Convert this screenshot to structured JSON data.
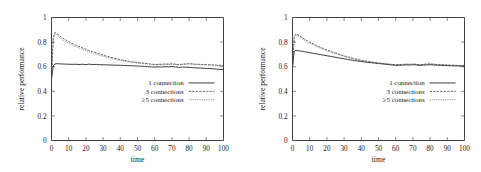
{
  "figure": {
    "panel_count": 2
  },
  "chart_data": [
    {
      "type": "line",
      "title": "",
      "xlabel": "time",
      "ylabel": "relative performance",
      "xlim": [
        0,
        100
      ],
      "ylim": [
        0,
        1
      ],
      "xticks": [
        0,
        10,
        20,
        30,
        40,
        50,
        60,
        70,
        80,
        90,
        100
      ],
      "xticklabels": [
        "0",
        "10",
        "20",
        "30",
        "40",
        "50",
        "60",
        "70",
        "80",
        "90",
        "100"
      ],
      "yticks": [
        0,
        0.2,
        0.4,
        0.6,
        0.8,
        1
      ],
      "yticklabels": [
        "0",
        "0.2",
        "0.4",
        "0.6",
        "0.8",
        "1"
      ],
      "grid": false,
      "legend_position": "center-right",
      "legend": [
        "1 connection",
        "3 connections",
        "≥5 connections"
      ],
      "x": [
        0,
        1,
        2,
        3,
        4,
        5,
        6,
        8,
        10,
        12,
        14,
        16,
        18,
        20,
        22,
        24,
        26,
        28,
        30,
        32,
        34,
        36,
        38,
        40,
        42,
        44,
        46,
        48,
        50,
        52,
        54,
        56,
        58,
        60,
        62,
        64,
        66,
        68,
        70,
        72,
        74,
        76,
        78,
        80,
        82,
        84,
        86,
        88,
        90,
        92,
        94,
        96,
        98,
        100
      ],
      "series": [
        {
          "name": "1 connection",
          "style": "solid",
          "values": [
            0.5,
            0.605,
            0.622,
            0.625,
            0.624,
            0.623,
            0.622,
            0.621,
            0.62,
            0.619,
            0.62,
            0.618,
            0.62,
            0.617,
            0.621,
            0.617,
            0.619,
            0.616,
            0.616,
            0.615,
            0.614,
            0.613,
            0.612,
            0.612,
            0.61,
            0.609,
            0.608,
            0.607,
            0.605,
            0.604,
            0.603,
            0.6,
            0.598,
            0.597,
            0.599,
            0.598,
            0.6,
            0.599,
            0.601,
            0.598,
            0.594,
            0.597,
            0.596,
            0.595,
            0.593,
            0.59,
            0.589,
            0.588,
            0.586,
            0.585,
            0.583,
            0.58,
            0.578,
            0.576
          ]
        },
        {
          "name": "3 connections",
          "style": "dashed",
          "values": [
            0.5,
            0.84,
            0.878,
            0.872,
            0.86,
            0.848,
            0.838,
            0.82,
            0.803,
            0.789,
            0.776,
            0.765,
            0.753,
            0.742,
            0.731,
            0.722,
            0.712,
            0.703,
            0.694,
            0.686,
            0.678,
            0.671,
            0.664,
            0.658,
            0.652,
            0.647,
            0.642,
            0.638,
            0.634,
            0.631,
            0.628,
            0.625,
            0.621,
            0.618,
            0.619,
            0.62,
            0.622,
            0.621,
            0.623,
            0.621,
            0.617,
            0.62,
            0.623,
            0.625,
            0.623,
            0.62,
            0.619,
            0.618,
            0.617,
            0.616,
            0.615,
            0.613,
            0.612,
            0.611
          ]
        },
        {
          "name": "≥5 connections",
          "style": "dotted",
          "values": [
            0.5,
            0.828,
            0.864,
            0.858,
            0.846,
            0.834,
            0.824,
            0.806,
            0.79,
            0.776,
            0.764,
            0.753,
            0.741,
            0.731,
            0.72,
            0.711,
            0.702,
            0.693,
            0.685,
            0.677,
            0.67,
            0.663,
            0.657,
            0.651,
            0.646,
            0.641,
            0.637,
            0.633,
            0.63,
            0.627,
            0.624,
            0.621,
            0.618,
            0.615,
            0.616,
            0.617,
            0.619,
            0.618,
            0.62,
            0.618,
            0.614,
            0.617,
            0.62,
            0.622,
            0.62,
            0.617,
            0.616,
            0.615,
            0.614,
            0.613,
            0.612,
            0.61,
            0.609,
            0.608
          ]
        }
      ]
    },
    {
      "type": "line",
      "title": "",
      "xlabel": "time",
      "ylabel": "relative performance",
      "xlim": [
        0,
        100
      ],
      "ylim": [
        0,
        1
      ],
      "xticks": [
        0,
        10,
        20,
        30,
        40,
        50,
        60,
        70,
        80,
        90,
        100
      ],
      "xticklabels": [
        "0",
        "10",
        "20",
        "30",
        "40",
        "50",
        "60",
        "70",
        "80",
        "90",
        "100"
      ],
      "yticks": [
        0,
        0.2,
        0.4,
        0.6,
        0.8,
        1
      ],
      "yticklabels": [
        "0",
        "0.2",
        "0.4",
        "0.6",
        "0.8",
        "1"
      ],
      "grid": false,
      "legend_position": "center-right",
      "legend": [
        "1 connection",
        "3 connections",
        "≥5 connections"
      ],
      "x": [
        0,
        1,
        2,
        3,
        4,
        5,
        6,
        8,
        10,
        12,
        14,
        16,
        18,
        20,
        22,
        24,
        26,
        28,
        30,
        32,
        34,
        36,
        38,
        40,
        42,
        44,
        46,
        48,
        50,
        52,
        54,
        56,
        58,
        60,
        62,
        64,
        66,
        68,
        70,
        72,
        74,
        76,
        78,
        80,
        82,
        84,
        86,
        88,
        90,
        92,
        94,
        96,
        98,
        100
      ],
      "series": [
        {
          "name": "1 connection",
          "style": "solid",
          "values": [
            0.595,
            0.726,
            0.733,
            0.731,
            0.729,
            0.727,
            0.724,
            0.719,
            0.714,
            0.709,
            0.704,
            0.699,
            0.694,
            0.689,
            0.684,
            0.679,
            0.674,
            0.669,
            0.664,
            0.659,
            0.654,
            0.65,
            0.646,
            0.642,
            0.638,
            0.635,
            0.632,
            0.629,
            0.626,
            0.623,
            0.62,
            0.617,
            0.614,
            0.611,
            0.612,
            0.613,
            0.615,
            0.614,
            0.616,
            0.614,
            0.611,
            0.613,
            0.615,
            0.616,
            0.614,
            0.612,
            0.611,
            0.61,
            0.609,
            0.608,
            0.607,
            0.606,
            0.605,
            0.604
          ]
        },
        {
          "name": "3 connections",
          "style": "dashed",
          "values": [
            0.595,
            0.848,
            0.866,
            0.86,
            0.851,
            0.842,
            0.833,
            0.816,
            0.8,
            0.786,
            0.773,
            0.76,
            0.748,
            0.737,
            0.726,
            0.716,
            0.706,
            0.697,
            0.688,
            0.68,
            0.672,
            0.665,
            0.658,
            0.652,
            0.647,
            0.642,
            0.638,
            0.634,
            0.63,
            0.627,
            0.624,
            0.621,
            0.618,
            0.616,
            0.617,
            0.619,
            0.621,
            0.62,
            0.622,
            0.62,
            0.616,
            0.619,
            0.622,
            0.623,
            0.621,
            0.618,
            0.617,
            0.616,
            0.614,
            0.613,
            0.612,
            0.611,
            0.61,
            0.609
          ]
        },
        {
          "name": "≥5 connections",
          "style": "dotted",
          "values": [
            0.595,
            0.838,
            0.856,
            0.85,
            0.841,
            0.832,
            0.823,
            0.806,
            0.791,
            0.777,
            0.764,
            0.752,
            0.741,
            0.73,
            0.72,
            0.71,
            0.701,
            0.692,
            0.684,
            0.676,
            0.669,
            0.662,
            0.656,
            0.65,
            0.645,
            0.641,
            0.637,
            0.633,
            0.629,
            0.626,
            0.623,
            0.62,
            0.617,
            0.614,
            0.615,
            0.616,
            0.618,
            0.617,
            0.619,
            0.617,
            0.613,
            0.616,
            0.618,
            0.62,
            0.618,
            0.616,
            0.615,
            0.613,
            0.612,
            0.611,
            0.61,
            0.609,
            0.608,
            0.607
          ]
        }
      ]
    }
  ]
}
